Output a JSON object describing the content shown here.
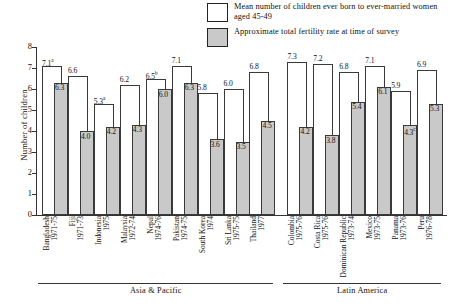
{
  "chart_data": {
    "type": "bar",
    "title": "",
    "xlabel": "",
    "ylabel": "Number of children",
    "ylim": [
      0,
      8
    ],
    "yticks": [
      0,
      1,
      2,
      3,
      4,
      5,
      6,
      7,
      8
    ],
    "grid": false,
    "legend_position": "top-right",
    "legend": [
      {
        "key": "mean_children",
        "swatch": "empty",
        "label": "Mean number of children ever born to ever-married women aged 45-49"
      },
      {
        "key": "fertility_rate",
        "swatch": "filled",
        "label": "Approximate total fertility rate at time of survey"
      }
    ],
    "groups": [
      {
        "name": "Asia & Pacific",
        "start": 0,
        "end": 8
      },
      {
        "name": "Latin America",
        "start": 9,
        "end": 14
      }
    ],
    "categories": [
      {
        "country": "Bangladesh",
        "years": "1971-75"
      },
      {
        "country": "Fiji",
        "years": "1971-73"
      },
      {
        "country": "Indonesia",
        "years": "1975"
      },
      {
        "country": "Malaysia",
        "years": "1972-74"
      },
      {
        "country": "Nepal",
        "years": "1974-76"
      },
      {
        "country": "Pakistan",
        "years": "1974-75"
      },
      {
        "country": "South Korea",
        "years": "1974"
      },
      {
        "country": "Sri Lanka",
        "years": "1975-75"
      },
      {
        "country": "Thailand",
        "years": "1977"
      },
      {
        "country": "Colombia",
        "years": "1975-76"
      },
      {
        "country": "Costa Rica",
        "years": "1975-76"
      },
      {
        "country": "Dominican Republic",
        "years": "1973-74"
      },
      {
        "country": "Mexico",
        "years": "1973-75"
      },
      {
        "country": "Panama",
        "years": "1973-76"
      },
      {
        "country": "Peru",
        "years": "1976-78"
      }
    ],
    "series": [
      {
        "name": "Mean number of children ever born to ever-married women aged 45-49",
        "style": "empty",
        "values": [
          7.1,
          6.6,
          5.3,
          6.2,
          6.5,
          7.1,
          5.8,
          6.0,
          6.8,
          7.3,
          7.2,
          6.8,
          7.1,
          5.9,
          6.9
        ],
        "labels": [
          "7.1",
          "6.6",
          "5.3",
          "6.2",
          "6.5",
          "7.1",
          "5.8",
          "6.0",
          "6.8",
          "7.3",
          "7.2",
          "6.8",
          "7.1",
          "5.9",
          "6.9"
        ],
        "marks": [
          "a",
          "",
          "a",
          "",
          "b",
          "",
          "",
          "",
          "",
          "",
          "",
          "",
          "",
          "",
          ""
        ]
      },
      {
        "name": "Approximate total fertility rate at time of survey",
        "style": "filled",
        "values": [
          6.3,
          4.0,
          4.2,
          4.3,
          6.0,
          6.3,
          3.6,
          3.5,
          4.5,
          4.2,
          3.8,
          5.4,
          6.1,
          4.3,
          5.3
        ],
        "labels": [
          "6.3",
          "4.0",
          "4.2",
          "4.3",
          "6.0",
          "6.3",
          "3.6",
          "3.5",
          "4.5",
          "4.2",
          "3.8",
          "5.4",
          "6.1",
          "4.3",
          "5.3"
        ],
        "marks": [
          "",
          "",
          "",
          "",
          "",
          "",
          "",
          "",
          "",
          "",
          "",
          "",
          "",
          "c",
          ""
        ]
      }
    ],
    "colors": {
      "empty_fill": "#ffffff",
      "filled_fill": "#c9c9c9",
      "outline": "#3a3a3a",
      "axis": "#333333"
    }
  }
}
